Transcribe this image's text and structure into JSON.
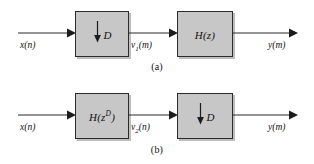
{
  "figure": {
    "type": "block-diagram",
    "stroke_color": "#2b2b2b",
    "block_fill_color": "#c7c7c7",
    "background_color": "#ffffff"
  },
  "rows": [
    {
      "id": "a",
      "caption": "(a)",
      "input_label_main": "x",
      "input_label_arg": "(n)",
      "blocks": [
        {
          "id": "downsampler-1",
          "kind": "downsampler",
          "arrow_icon": "down-arrow-icon",
          "label": "D"
        },
        {
          "id": "filter-hz",
          "kind": "filter",
          "label_main": "H(z)",
          "label_base": "H(z",
          "label_sup": "",
          "label_close": ")"
        }
      ],
      "intermediate_label_main": "v",
      "intermediate_label_sub": "1",
      "intermediate_label_arg": "(m)",
      "output_label_main": "y",
      "output_label_arg": "(m)"
    },
    {
      "id": "b",
      "caption": "(b)",
      "input_label_main": "x",
      "input_label_arg": "(n)",
      "blocks": [
        {
          "id": "filter-hzd",
          "kind": "filter",
          "label_main": "H(z^D)",
          "label_base": "H(z",
          "label_sup": "D",
          "label_close": ")"
        },
        {
          "id": "downsampler-2",
          "kind": "downsampler",
          "arrow_icon": "down-arrow-icon",
          "label": "D"
        }
      ],
      "intermediate_label_main": "v",
      "intermediate_label_sub": "2",
      "intermediate_label_arg": "(n)",
      "output_label_main": "y",
      "output_label_arg": "(m)"
    }
  ]
}
